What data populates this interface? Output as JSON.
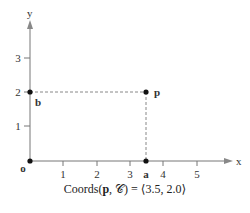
{
  "diagram": {
    "axes": {
      "x_label": "x",
      "y_label": "y"
    },
    "x_ticks": [
      "1",
      "2",
      "3",
      "4",
      "5"
    ],
    "y_ticks": [
      "1",
      "2",
      "3"
    ],
    "points": {
      "origin": {
        "label": "o",
        "x": 0,
        "y": 0
      },
      "a": {
        "label": "a",
        "x": 3.5,
        "y": 0
      },
      "b": {
        "label": "b",
        "x": 0,
        "y": 2.0
      },
      "p": {
        "label": "p",
        "x": 3.5,
        "y": 2.0
      }
    },
    "caption": {
      "prefix": "Coords(",
      "point": "p",
      "sep": ", ",
      "frame": "𝒞",
      "suffix": ") = ⟨3.5, 2.0⟩"
    }
  }
}
